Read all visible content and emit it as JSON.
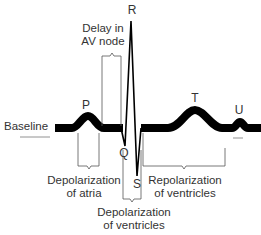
{
  "diagram": {
    "wave_labels": {
      "P": "P",
      "Q": "Q",
      "R": "R",
      "S": "S",
      "T": "T",
      "U": "U"
    },
    "baseline_label": "Baseline",
    "annotations": {
      "av_delay_line1": "Delay in",
      "av_delay_line2": "AV node",
      "atria_line1": "Depolarization",
      "atria_line2": "of atria",
      "ventricles_depol_line1": "Depolarization",
      "ventricles_depol_line2": "of ventricles",
      "ventricles_repol_line1": "Repolarization",
      "ventricles_repol_line2": "of ventricles"
    },
    "colors": {
      "trace": "#000000",
      "bracket": "#555555",
      "text": "#333333"
    }
  }
}
